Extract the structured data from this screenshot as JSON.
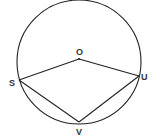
{
  "diagram": {
    "type": "circle-geometry",
    "stroke_color": "#222222",
    "circle": {
      "center": [
        79,
        62
      ],
      "radius": 62
    },
    "center_point": {
      "label": "O",
      "pos": [
        79,
        59
      ],
      "label_pos": [
        79,
        55
      ]
    },
    "points": [
      {
        "id": "S",
        "label": "S",
        "pos": [
          19,
          80
        ],
        "label_pos": [
          9,
          86
        ]
      },
      {
        "id": "U",
        "label": "U",
        "pos": [
          139,
          76
        ],
        "label_pos": [
          141,
          80
        ]
      },
      {
        "id": "V",
        "label": "V",
        "pos": [
          79,
          122
        ],
        "label_pos": [
          76,
          135
        ]
      }
    ],
    "segments": [
      [
        "O",
        "S"
      ],
      [
        "O",
        "U"
      ],
      [
        "S",
        "V"
      ],
      [
        "U",
        "V"
      ]
    ]
  }
}
